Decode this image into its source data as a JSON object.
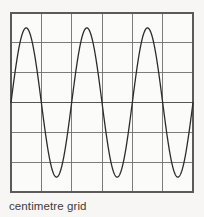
{
  "figure": {
    "caption": "centimetre grid",
    "background_color": "#f7f6f4"
  },
  "grid": {
    "label": "centimetre grid",
    "columns": 6,
    "rows": 6,
    "cell_size_px": 30,
    "left_px": 11,
    "top_px": 13,
    "right_px": 193,
    "bottom_px": 192,
    "line_color": "#6e6e6e",
    "border_color": "#5a5a5a",
    "axis_line_color": "#555555",
    "axis_y_px": 103
  },
  "chart_data": {
    "type": "line",
    "title": "",
    "subtitle": "",
    "xlabel": "",
    "ylabel": "",
    "caption": "centimetre grid",
    "grid": true,
    "legend": false,
    "legend_position": "none",
    "xlim": [
      0,
      6
    ],
    "ylim": [
      -3,
      3
    ],
    "xticks": [
      0,
      1,
      2,
      3,
      4,
      5,
      6
    ],
    "yticks": [
      -3,
      -2,
      -1,
      0,
      1,
      2,
      3
    ],
    "xtick_labels": [
      "",
      "",
      "",
      "",
      "",
      "",
      ""
    ],
    "ytick_labels": [
      "",
      "",
      "",
      "",
      "",
      "",
      ""
    ],
    "x_unit": "cm",
    "y_unit": "cm",
    "series": [
      {
        "name": "sine wave",
        "color": "#2b2b2b",
        "line_width": 1.3,
        "waveform": "sine",
        "amplitude": 2.5,
        "period": 2,
        "wavelength": 2,
        "cycles": 3,
        "phase": 0,
        "offset": 0,
        "peaks_x": [
          0.5,
          2.5,
          4.5
        ],
        "peaks_y": [
          2.5,
          2.5,
          2.5
        ],
        "troughs_x": [
          1.5,
          3.5,
          5.5
        ],
        "troughs_y": [
          -2.5,
          -2.5,
          -2.5
        ],
        "zero_crossings_x": [
          0,
          1,
          2,
          3,
          4,
          5,
          6
        ]
      }
    ]
  }
}
